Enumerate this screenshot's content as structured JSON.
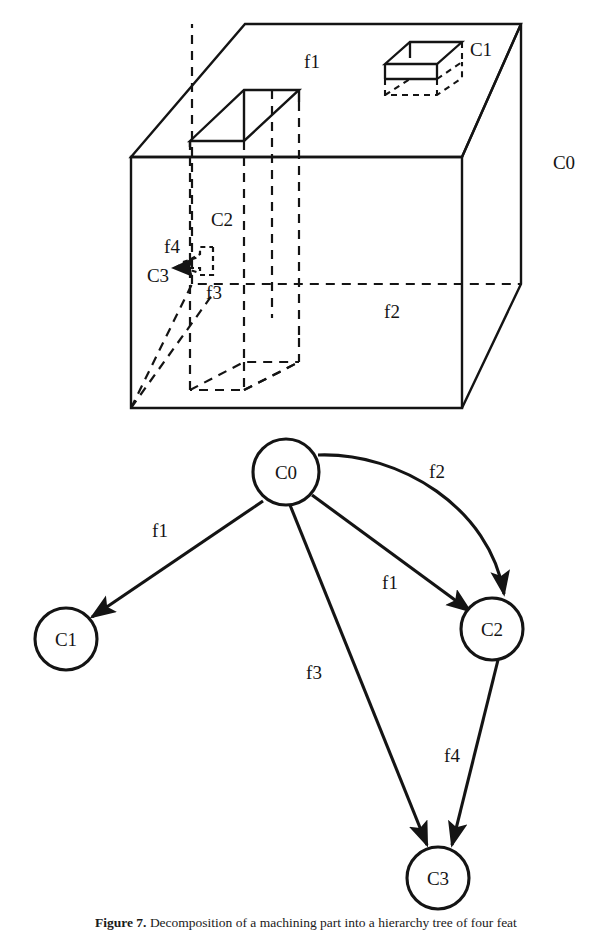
{
  "figure": {
    "caption_label": "Figure 7.",
    "caption_text": " Decomposition of a machining part into a hierarchy tree of four feat"
  },
  "solid_model": {
    "labels": {
      "c0": "C0",
      "c1": "C1",
      "c2": "C2",
      "c3": "C3",
      "f1": "f1",
      "f2": "f2",
      "f3": "f3",
      "f4": "f4"
    }
  },
  "graph": {
    "type": "directed-graph",
    "nodes": [
      {
        "id": "C0",
        "label": "C0",
        "cx": 286,
        "cy": 472,
        "r": 33
      },
      {
        "id": "C1",
        "label": "C1",
        "cx": 66,
        "cy": 639,
        "r": 31
      },
      {
        "id": "C2",
        "label": "C2",
        "cx": 492,
        "cy": 629,
        "r": 31
      },
      {
        "id": "C3",
        "label": "C3",
        "cx": 438,
        "cy": 878,
        "r": 31
      }
    ],
    "edges": [
      {
        "from": "C0",
        "to": "C1",
        "label": "f1",
        "lx": 160,
        "ly": 531
      },
      {
        "from": "C0",
        "to": "C2",
        "label": "f2",
        "lx": 437,
        "ly": 472
      },
      {
        "from": "C0",
        "to": "C2",
        "label": "f1",
        "lx": 390,
        "ly": 583
      },
      {
        "from": "C0",
        "to": "C3",
        "label": "f3",
        "lx": 314,
        "ly": 673
      },
      {
        "from": "C2",
        "to": "C3",
        "label": "f4",
        "lx": 452,
        "ly": 756
      }
    ]
  },
  "colors": {
    "ink": "#141414",
    "background": "#ffffff"
  }
}
